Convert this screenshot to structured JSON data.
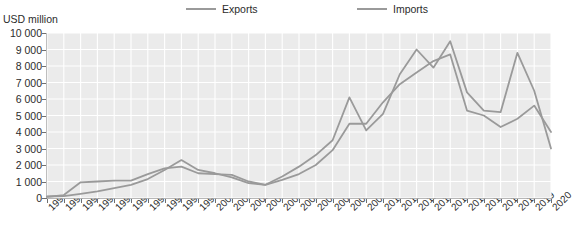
{
  "chart_data": {
    "type": "line",
    "title": "",
    "subtitle": "",
    "xlabel": "",
    "ylabel": "USD million",
    "ylim": [
      0,
      10000
    ],
    "ytick_labels": [
      "0",
      "1 000",
      "2 000",
      "3 000",
      "4 000",
      "5 000",
      "6 000",
      "7 000",
      "8 000",
      "9 000",
      "10 000"
    ],
    "ytick_values": [
      0,
      1000,
      2000,
      3000,
      4000,
      5000,
      6000,
      7000,
      8000,
      9000,
      10000
    ],
    "grid": true,
    "legend_position": "top",
    "categories": [
      "1990",
      "1991",
      "1992",
      "1993",
      "1994",
      "1995",
      "1996",
      "1997",
      "1998",
      "1999",
      "2000",
      "2001",
      "2002",
      "2003",
      "2004",
      "2005",
      "2006",
      "2007",
      "2008",
      "2009",
      "2010",
      "2011",
      "2012",
      "2013",
      "2014",
      "2015",
      "2016",
      "2017",
      "2018",
      "2019",
      "2020"
    ],
    "series": [
      {
        "name": "Exports",
        "color": "#9a9a9a",
        "values": [
          90,
          120,
          250,
          400,
          600,
          800,
          1150,
          1700,
          2300,
          1700,
          1500,
          1250,
          900,
          800,
          1300,
          1900,
          2600,
          3500,
          6100,
          4100,
          5100,
          7500,
          9000,
          7900,
          9500,
          6400,
          5300,
          5200,
          8800,
          6500,
          3000
        ]
      },
      {
        "name": "Imports",
        "color": "#9a9a9a",
        "values": [
          70,
          180,
          950,
          1000,
          1050,
          1050,
          1450,
          1800,
          1900,
          1500,
          1450,
          1400,
          1000,
          800,
          1100,
          1450,
          2000,
          2900,
          4500,
          4500,
          5800,
          6900,
          7600,
          8300,
          8700,
          5300,
          5000,
          4300,
          4800,
          5600,
          4000
        ]
      }
    ]
  }
}
